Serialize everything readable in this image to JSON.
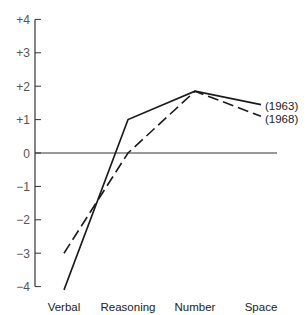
{
  "chart_data": {
    "type": "line",
    "title": "",
    "xlabel": "",
    "ylabel": "",
    "categories": [
      "Verbal",
      "Reasoning",
      "Number",
      "Space"
    ],
    "ylim": [
      -4,
      4
    ],
    "y_ticks": [
      "+4",
      "+3",
      "+2",
      "+1",
      "0",
      "−1",
      "−2",
      "−3",
      "−4"
    ],
    "grid": false,
    "series": [
      {
        "name": "(1963)",
        "style": "solid",
        "values": [
          -4.1,
          1.0,
          1.85,
          1.45
        ]
      },
      {
        "name": "(1968)",
        "style": "dashed",
        "values": [
          -3.0,
          0.0,
          1.85,
          1.1
        ]
      }
    ],
    "legend_position": "inline-right"
  },
  "colors": {
    "axis": "#333333",
    "line": "#1a1a1a",
    "text": "#222222",
    "tick_label": "#555555"
  }
}
